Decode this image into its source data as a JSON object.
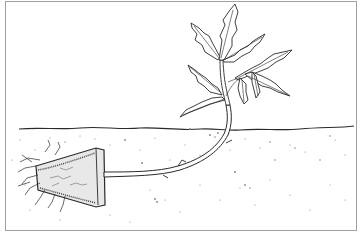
{
  "illustration": {
    "subject": "tomato seedling planted horizontally with root ball buried in soil",
    "colors": {
      "ink": "#2a2a2a",
      "paper": "#ffffff",
      "frame": "#9a9a9a",
      "soil_dots": "#8a8a8a"
    }
  }
}
